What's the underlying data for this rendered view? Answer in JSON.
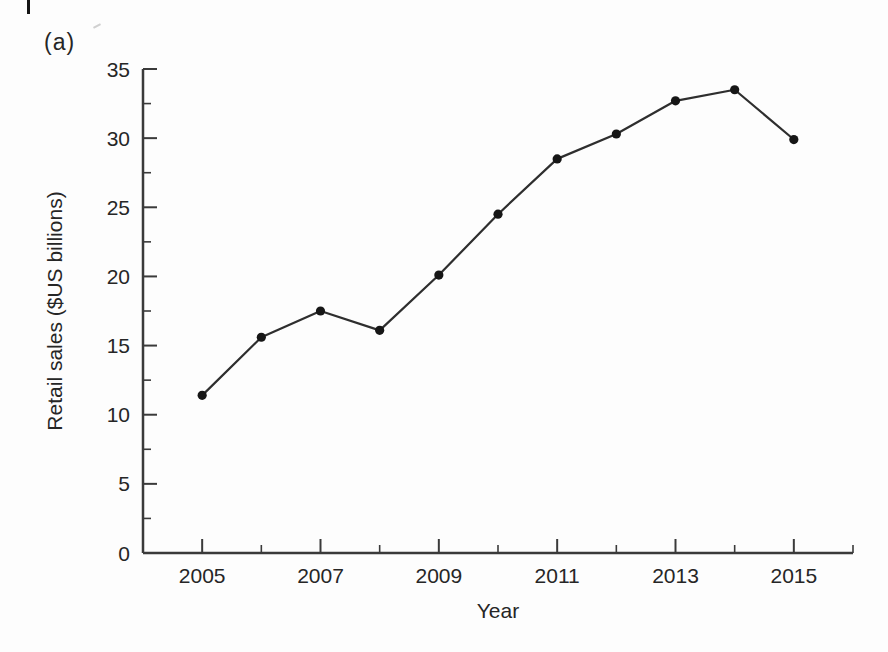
{
  "figure_label": "(a)",
  "chart_data": {
    "type": "line",
    "title": "",
    "xlabel": "Year",
    "ylabel": "Retail sales ($US billions)",
    "x": [
      2005,
      2006,
      2007,
      2008,
      2009,
      2010,
      2011,
      2012,
      2013,
      2014,
      2015
    ],
    "values": [
      11.4,
      15.6,
      17.5,
      16.1,
      20.1,
      24.5,
      28.5,
      30.3,
      32.7,
      33.5,
      29.9
    ],
    "xlim": [
      2004,
      2016
    ],
    "ylim": [
      0,
      35
    ],
    "x_major_ticks": [
      "2005",
      "2007",
      "2009",
      "2011",
      "2013",
      "2015"
    ],
    "x_major_tick_values": [
      2005,
      2007,
      2009,
      2011,
      2013,
      2015
    ],
    "x_minor_tick_values": [
      2006,
      2008,
      2010,
      2012,
      2014,
      2016
    ],
    "y_major_ticks": [
      "0",
      "5",
      "10",
      "15",
      "20",
      "25",
      "30",
      "35"
    ],
    "y_major_tick_values": [
      0,
      5,
      10,
      15,
      20,
      25,
      30,
      35
    ],
    "y_minor_tick_values": [
      2.5,
      7.5,
      12.5,
      17.5,
      22.5,
      27.5,
      32.5
    ],
    "grid": false,
    "legend_position": "none",
    "marker": "filled-circle",
    "colors": {
      "line": "#2e2e2e",
      "marker": "#161616",
      "axis": "#3a3a3a",
      "text": "#262626"
    }
  }
}
